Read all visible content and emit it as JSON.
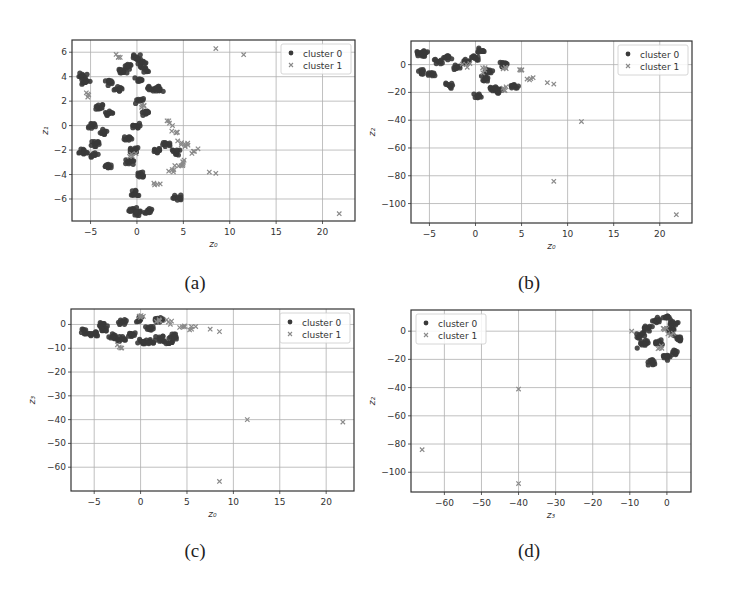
{
  "figure": {
    "captions": [
      "(a)",
      "(b)",
      "(c)",
      "(d)"
    ]
  },
  "colors": {
    "cluster0": "#3a3a3a",
    "cluster1": "#8a8a8a",
    "grid": "#b0b0b0",
    "frame": "#333333"
  },
  "chart_data": [
    {
      "id": "a",
      "type": "scatter",
      "title": "",
      "xlabel": "z0",
      "ylabel": "z1",
      "xlim": [
        -7,
        23.5
      ],
      "ylim": [
        -7.8,
        7.0
      ],
      "xticks": [
        -5,
        0,
        5,
        10,
        15,
        20
      ],
      "yticks": [
        -6,
        -4,
        -2,
        0,
        2,
        4,
        6
      ],
      "grid": true,
      "legend": {
        "position": "upper right",
        "entries": [
          "cluster 0",
          "cluster 1"
        ]
      },
      "series": [
        {
          "name": "cluster 0",
          "marker": "circle",
          "description": "dense vertical cloud centered near z0=0, spanning z1 from about -7 to 5.7; a few points near z0=-5.5",
          "points": [
            [
              0,
              5.6
            ],
            [
              0.5,
              5.2
            ],
            [
              -1,
              4.8
            ],
            [
              -1.5,
              4.4
            ],
            [
              0.8,
              4.6
            ],
            [
              -5.8,
              4.1
            ],
            [
              -5.5,
              3.6
            ],
            [
              -3,
              3.5
            ],
            [
              -2,
              3
            ],
            [
              1.5,
              3
            ],
            [
              2.5,
              3
            ],
            [
              -4,
              1.5
            ],
            [
              -3,
              1
            ],
            [
              -4.8,
              0
            ],
            [
              -3.5,
              -0.5
            ],
            [
              -4.5,
              -1.5
            ],
            [
              -5.8,
              -2.1
            ],
            [
              -4.5,
              -2.4
            ],
            [
              -3,
              -3.3
            ],
            [
              2,
              -2
            ],
            [
              3.2,
              -1.5
            ],
            [
              4.2,
              -2.2
            ],
            [
              4.3,
              -5.9
            ],
            [
              1.2,
              -7
            ],
            [
              0,
              -7.2
            ],
            [
              -0.5,
              -6.8
            ],
            [
              0,
              0
            ],
            [
              0.3,
              2
            ],
            [
              -0.3,
              -2
            ],
            [
              0.5,
              -4
            ],
            [
              -0.2,
              -5.5
            ],
            [
              1,
              1
            ],
            [
              -1,
              -1
            ],
            [
              0.2,
              3.8
            ],
            [
              -0.8,
              -3
            ]
          ]
        },
        {
          "name": "cluster 1",
          "marker": "x",
          "description": "overlaps cluster 0 and trails toward positive z0 with outliers",
          "points": [
            [
              -2,
              5.6
            ],
            [
              8.5,
              6.3
            ],
            [
              11.5,
              5.8
            ],
            [
              -5.2,
              2.5
            ],
            [
              3.5,
              0.2
            ],
            [
              4.2,
              -0.6
            ],
            [
              4.8,
              -1.4
            ],
            [
              5.5,
              -1.6
            ],
            [
              6.2,
              -2.1
            ],
            [
              5,
              -3
            ],
            [
              4.5,
              -3.3
            ],
            [
              3.8,
              -3.6
            ],
            [
              7.8,
              -3.8
            ],
            [
              8.5,
              -3.9
            ],
            [
              2.2,
              -4.8
            ],
            [
              21.8,
              -7.2
            ],
            [
              0.5,
              1.5
            ],
            [
              -0.5,
              -2.5
            ]
          ]
        }
      ]
    },
    {
      "id": "b",
      "type": "scatter",
      "title": "",
      "xlabel": "z0",
      "ylabel": "z2",
      "xlim": [
        -7,
        23.5
      ],
      "ylim": [
        -114,
        17
      ],
      "xticks": [
        -5,
        0,
        5,
        10,
        15,
        20
      ],
      "yticks": [
        -100,
        -80,
        -60,
        -40,
        -20,
        0
      ],
      "grid": true,
      "legend": {
        "position": "upper right",
        "entries": [
          "cluster 0",
          "cluster 1"
        ]
      },
      "series": [
        {
          "name": "cluster 0",
          "marker": "circle",
          "description": "horizontal band near z2=0 for z0 in [-6,4.5]",
          "points": [
            [
              -6,
              8
            ],
            [
              -5.5,
              8
            ],
            [
              -5.8,
              -5
            ],
            [
              -4.8,
              -7
            ],
            [
              -3,
              5
            ],
            [
              -2,
              -2
            ],
            [
              -2.8,
              -15
            ],
            [
              0,
              5
            ],
            [
              0.5,
              10
            ],
            [
              1,
              -10
            ],
            [
              2.5,
              -19
            ],
            [
              2,
              -17
            ],
            [
              0.2,
              -22
            ],
            [
              4.2,
              -15
            ],
            [
              -1,
              2
            ],
            [
              1.5,
              -5
            ],
            [
              3,
              0
            ],
            [
              -4,
              2
            ]
          ]
        },
        {
          "name": "cluster 1",
          "marker": "x",
          "description": "trails to the right with far outliers",
          "points": [
            [
              3,
              -3
            ],
            [
              5,
              -4
            ],
            [
              6,
              -10
            ],
            [
              7.8,
              -13
            ],
            [
              8.5,
              -14
            ],
            [
              3,
              -17
            ],
            [
              11.5,
              -41
            ],
            [
              8.5,
              -84
            ],
            [
              21.8,
              -108
            ],
            [
              1,
              -4
            ],
            [
              -1,
              0
            ]
          ]
        }
      ]
    },
    {
      "id": "c",
      "type": "scatter",
      "title": "",
      "xlabel": "z0",
      "ylabel": "z3",
      "xlim": [
        -7.5,
        23
      ],
      "ylim": [
        -70,
        6.5
      ],
      "xticks": [
        -5,
        0,
        5,
        10,
        15,
        20
      ],
      "yticks": [
        -60,
        -50,
        -40,
        -30,
        -20,
        -10,
        0
      ],
      "grid": true,
      "legend": {
        "position": "upper right",
        "entries": [
          "cluster 0",
          "cluster 1"
        ]
      },
      "series": [
        {
          "name": "cluster 0",
          "marker": "circle",
          "description": "flat band near z3=0 for z0 in [-6,4]",
          "points": [
            [
              -6,
              -3
            ],
            [
              -5,
              -4
            ],
            [
              -4,
              -2
            ],
            [
              -3,
              -5
            ],
            [
              -2,
              -6
            ],
            [
              -1,
              -4
            ],
            [
              0,
              -7
            ],
            [
              1,
              -7
            ],
            [
              2,
              -6
            ],
            [
              3,
              -8
            ],
            [
              3.5,
              -5
            ],
            [
              0,
              2
            ],
            [
              -2,
              1
            ],
            [
              2,
              2
            ],
            [
              -4,
              0
            ],
            [
              1,
              -2
            ]
          ]
        },
        {
          "name": "cluster 1",
          "marker": "x",
          "description": "upper band with outliers",
          "points": [
            [
              3,
              1
            ],
            [
              4.5,
              -1
            ],
            [
              5.5,
              -2
            ],
            [
              7.5,
              -2
            ],
            [
              8.5,
              -3
            ],
            [
              -2.3,
              -9.5
            ],
            [
              11.5,
              -40
            ],
            [
              21.8,
              -41
            ],
            [
              8.5,
              -66
            ],
            [
              0,
              3
            ],
            [
              2,
              2
            ]
          ]
        }
      ]
    },
    {
      "id": "d",
      "type": "scatter",
      "title": "",
      "xlabel": "z3",
      "ylabel": "z2",
      "xlim": [
        -69,
        6.5
      ],
      "ylim": [
        -114,
        15
      ],
      "xticks": [
        -60,
        -50,
        -40,
        -30,
        -20,
        -10,
        0
      ],
      "yticks": [
        -100,
        -80,
        -60,
        -40,
        -20,
        0
      ],
      "grid": true,
      "legend": {
        "position": "upper left",
        "entries": [
          "cluster 0",
          "cluster 1"
        ]
      },
      "series": [
        {
          "name": "cluster 0",
          "marker": "circle",
          "description": "compact blob near (z3=0, z2=0)",
          "points": [
            [
              0,
              10
            ],
            [
              2,
              5
            ],
            [
              -5,
              2
            ],
            [
              -7,
              -3
            ],
            [
              -8,
              -12
            ],
            [
              -4,
              -22
            ],
            [
              0,
              -19
            ],
            [
              2,
              -15
            ],
            [
              -2,
              -8
            ],
            [
              1,
              0
            ],
            [
              -3,
              8
            ],
            [
              3,
              -5
            ],
            [
              -6,
              -8
            ]
          ]
        },
        {
          "name": "cluster 1",
          "marker": "x",
          "description": "within blob plus outliers",
          "points": [
            [
              -9.5,
              0
            ],
            [
              -2,
              -12
            ],
            [
              -40,
              -41
            ],
            [
              -66,
              -84
            ],
            [
              -40,
              -108
            ],
            [
              1,
              -3
            ],
            [
              -1,
              2
            ]
          ]
        }
      ]
    }
  ]
}
